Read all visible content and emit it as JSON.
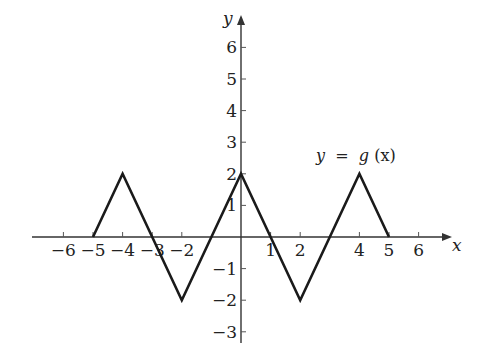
{
  "chart_data": {
    "type": "line",
    "title": "",
    "xlabel": "x",
    "ylabel": "y",
    "xlim": [
      -6.5,
      6.5
    ],
    "ylim": [
      -3.3,
      6.7
    ],
    "x_ticks": [
      -6,
      -5,
      -4,
      -3,
      -2,
      1,
      2,
      4,
      5,
      6
    ],
    "x_tick_labels": [
      "−6",
      "−5",
      "−4",
      "−3",
      "−2",
      "1",
      "2",
      "4",
      "5",
      "6"
    ],
    "y_ticks": [
      6,
      5,
      4,
      3,
      2,
      1,
      -1,
      -2,
      -3
    ],
    "y_tick_labels": [
      "6",
      "5",
      "4",
      "3",
      "2",
      "1",
      "−1",
      "−2",
      "−3"
    ],
    "grid": false,
    "series": [
      {
        "name": "y = g(x)",
        "x": [
          -5,
          -4,
          -2,
          0,
          2,
          4,
          5
        ],
        "y": [
          0,
          2,
          -2,
          2,
          -2,
          2,
          0
        ]
      }
    ],
    "annotations": [
      {
        "text": "y = g(x)",
        "x": 3.2,
        "y": 2.6
      }
    ],
    "colors": {
      "line": "#1a1a1a",
      "axis": "#333333",
      "background": "#ffffff"
    }
  },
  "labels": {
    "x_axis": "x",
    "y_axis": "y",
    "function_lhs": "y",
    "function_eq": " = ",
    "function_rhs_name": "g",
    "function_rhs_arg": "(x)"
  }
}
